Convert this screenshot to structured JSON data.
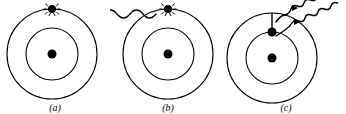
{
  "figure": {
    "width": 346,
    "height": 114,
    "background_color": "#ffffff",
    "stroke_color": "#000000"
  },
  "panels": [
    {
      "id": "a",
      "label": "(a)",
      "caption": "Excited atom with electron vibrating in outer orbit",
      "atom": {
        "center_x": 52,
        "center_y": 54,
        "outer_radius": 45,
        "inner_radius": 26,
        "nucleus_radius": 4.5,
        "nucleus_label": "nucleus"
      },
      "electron": {
        "x": 52,
        "y": 9,
        "radius": 4,
        "orbit": "outer",
        "state": "excited-vibrating",
        "sparkle_count": 8
      },
      "waves": []
    },
    {
      "id": "b",
      "label": "(b)",
      "caption": "Incoming photon strikes the orbiting electron",
      "atom": {
        "center_x": 58,
        "center_y": 54,
        "outer_radius": 45,
        "inner_radius": 26,
        "nucleus_radius": 4.5,
        "nucleus_label": "nucleus"
      },
      "electron": {
        "x": 58,
        "y": 9,
        "radius": 4,
        "orbit": "outer",
        "state": "excited-vibrating",
        "sparkle_count": 8
      },
      "waves": [
        {
          "name": "incoming-photon",
          "direction": "incoming",
          "start_x": -4,
          "end_x": 50,
          "y": 14,
          "amplitude": 6,
          "cycles": 4,
          "arrowhead": false
        }
      ]
    },
    {
      "id": "c",
      "label": "(c)",
      "caption": "Electron drops to inner orbit emitting two photons",
      "atom": {
        "center_x": 46,
        "center_y": 58,
        "outer_radius": 45,
        "inner_radius": 26,
        "nucleus_radius": 4.5,
        "nucleus_label": "nucleus"
      },
      "electron": {
        "x": 46,
        "y": 32,
        "radius": 4.5,
        "orbit": "inner",
        "state": "de-excited",
        "sparkle_count": 0
      },
      "transition_line": {
        "name": "electron-drop-path",
        "from_x": 46,
        "from_y": 13,
        "to_x": 46,
        "to_y": 32
      },
      "waves": [
        {
          "name": "emitted-photon-upper",
          "direction": "outgoing",
          "start_x": 56,
          "end_x": 118,
          "y": 13,
          "amplitude": 6,
          "cycles": 5,
          "arrowhead": true
        },
        {
          "name": "emitted-photon-lower",
          "direction": "outgoing",
          "start_x": 56,
          "end_x": 118,
          "y": 27,
          "amplitude": 6,
          "cycles": 5,
          "arrowhead": true
        }
      ]
    }
  ]
}
